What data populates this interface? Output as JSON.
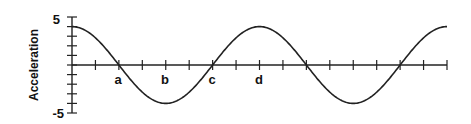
{
  "chart_data": {
    "type": "line",
    "title": "",
    "xlabel": "",
    "ylabel": "Acceleration",
    "ylim": [
      -5,
      5
    ],
    "y_ticks_labeled": [
      "5",
      "-5"
    ],
    "y_tick_step": 1,
    "x_tick_count": 16,
    "x_point_labels": [
      {
        "label": "a",
        "tick": 2
      },
      {
        "label": "b",
        "tick": 4
      },
      {
        "label": "c",
        "tick": 6
      },
      {
        "label": "d",
        "tick": 8
      }
    ],
    "grid": false,
    "legend": null,
    "series": [
      {
        "name": "acceleration",
        "function": "4*cos(2*pi*t/8)",
        "amplitude": 4,
        "period_ticks": 8,
        "x": [
          0,
          1,
          2,
          3,
          4,
          5,
          6,
          7,
          8,
          9,
          10,
          11,
          12,
          13,
          14,
          15,
          16
        ],
        "values": [
          4,
          2.83,
          0,
          -2.83,
          -4,
          -2.83,
          0,
          2.83,
          4,
          2.83,
          0,
          -2.83,
          -4,
          -2.83,
          0,
          2.83,
          4
        ]
      }
    ]
  },
  "labels": {
    "ylabel": "Acceleration",
    "ymax": "5",
    "ymin": "-5",
    "a": "a",
    "b": "b",
    "c": "c",
    "d": "d"
  }
}
